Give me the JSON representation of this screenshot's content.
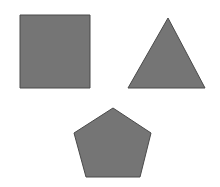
{
  "canvas": {
    "width": 220,
    "height": 187,
    "background_color": "#ffffff",
    "title": "Geometric Shapes"
  },
  "style": {
    "fill_color": "#757575",
    "stroke_color": "#4a4a4a",
    "stroke_width": 1
  },
  "shapes": [
    {
      "name": "square",
      "label": "Square",
      "sides": 4,
      "fill_color": "#757575",
      "stroke_color": "#4a4a4a",
      "position": "top-left",
      "bbox": {
        "x": 20,
        "y": 15,
        "width": 70,
        "height": 73
      },
      "points": "20,15 90,15 90,88 20,88"
    },
    {
      "name": "triangle",
      "label": "Triangle",
      "sides": 3,
      "fill_color": "#757575",
      "stroke_color": "#4a4a4a",
      "position": "top-right",
      "bbox": {
        "x": 128,
        "y": 18,
        "width": 77,
        "height": 70
      },
      "points": "168,18 205,88 128,88"
    },
    {
      "name": "pentagon",
      "label": "Pentagon",
      "sides": 5,
      "fill_color": "#757575",
      "stroke_color": "#4a4a4a",
      "position": "bottom-center",
      "bbox": {
        "x": 74,
        "y": 108,
        "width": 77,
        "height": 69
      },
      "points": "113,108 151,133 140,177 86,177 74,133"
    }
  ]
}
